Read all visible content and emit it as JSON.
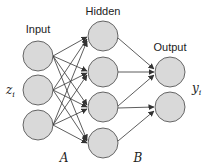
{
  "diagram": {
    "layers": [
      {
        "name": "input",
        "label": "Input",
        "side_label": "z_i",
        "nodes": 3
      },
      {
        "name": "hidden",
        "label": "Hidden",
        "nodes": 4
      },
      {
        "name": "output",
        "label": "Output",
        "side_label": "y_i",
        "nodes": 2
      }
    ],
    "labels": {
      "input": "Input",
      "hidden": "Hidden",
      "output": "Output",
      "input_var": "z",
      "input_sub": "i",
      "output_var": "y",
      "output_sub": "i",
      "weights_A": "A",
      "weights_B": "B"
    },
    "connections": {
      "A": "fully connected input → hidden",
      "B": "fully connected hidden → output"
    },
    "colors": {
      "node_fill": "#d9d9d9",
      "node_stroke": "#444444",
      "edge": "#333333"
    }
  }
}
